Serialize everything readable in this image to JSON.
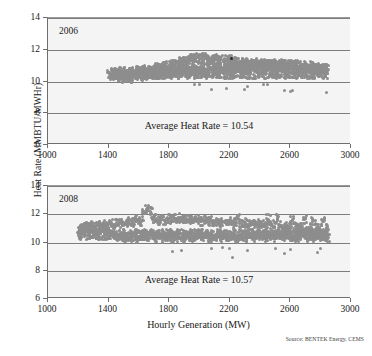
{
  "figure": {
    "xlabel": "Hourly Generation (MW)",
    "ylabel": "Heat Rate (MMBTU/MWHr)",
    "source_note": "Source: BENTEK Energy, CEMS"
  },
  "chart_data": [
    {
      "type": "scatter",
      "panel_label": "2006",
      "title": "",
      "xlabel": "Hourly Generation (MW)",
      "ylabel": "Heat Rate (MMBTU/MWHr)",
      "xlim": [
        1000,
        3000
      ],
      "ylim": [
        6,
        14
      ],
      "xticks": [
        1000,
        1400,
        1800,
        2200,
        2600,
        3000
      ],
      "yticks": [
        6,
        8,
        10,
        12,
        14
      ],
      "grid": "horizontal",
      "legend": "none",
      "annotation": "Average Heat Rate = 10.54",
      "average_heat_rate": 10.54,
      "marker_color": "#8d8d8d",
      "x": [
        1405,
        1418,
        1430,
        1442,
        1455,
        1462,
        1470,
        1478,
        1488,
        1495,
        1505,
        1512,
        1520,
        1528,
        1536,
        1544,
        1552,
        1560,
        1568,
        1576,
        1584,
        1592,
        1600,
        1608,
        1616,
        1624,
        1632,
        1640,
        1648,
        1656,
        1664,
        1672,
        1680,
        1688,
        1696,
        1704,
        1712,
        1720,
        1728,
        1736,
        1744,
        1752,
        1760,
        1768,
        1776,
        1784,
        1792,
        1800,
        1808,
        1816,
        1824,
        1832,
        1840,
        1848,
        1856,
        1864,
        1872,
        1880,
        1888,
        1896,
        1904,
        1912,
        1920,
        1928,
        1936,
        1944,
        1952,
        1960,
        1968,
        1976,
        1984,
        1992,
        2000,
        2008,
        2016,
        2024,
        2032,
        2040,
        2048,
        2056,
        2064,
        2072,
        2080,
        2088,
        2096,
        2104,
        2112,
        2120,
        2128,
        2136,
        2144,
        2152,
        2160,
        2168,
        2176,
        2184,
        2192,
        2200,
        2208,
        2216,
        2224,
        2232,
        2240,
        2248,
        2256,
        2264,
        2272,
        2280,
        2288,
        2296,
        2304,
        2312,
        2320,
        2328,
        2336,
        2344,
        2352,
        2360,
        2368,
        2376,
        2384,
        2392,
        2400,
        2408,
        2416,
        2424,
        2432,
        2440,
        2448,
        2456,
        2464,
        2472,
        2480,
        2488,
        2496,
        2504,
        2512,
        2520,
        2528,
        2536,
        2544,
        2552,
        2560,
        2568,
        2576,
        2584,
        2592,
        2600,
        2608,
        2616,
        2624,
        2632,
        2640,
        2648,
        2656,
        2664,
        2672,
        2680,
        2688,
        2696,
        2704,
        2712,
        2720,
        2728,
        2736,
        2744,
        2752,
        2760,
        2768,
        2776,
        2784,
        2792,
        2800,
        2808,
        2816,
        2824,
        2832,
        2840
      ],
      "y": [
        10.42,
        10.4,
        10.45,
        10.38,
        10.48,
        10.35,
        10.52,
        10.3,
        10.44,
        10.2,
        10.5,
        10.28,
        10.46,
        10.33,
        10.55,
        10.25,
        10.6,
        10.36,
        10.58,
        10.42,
        10.65,
        10.38,
        10.62,
        10.45,
        10.7,
        10.4,
        10.68,
        10.5,
        10.72,
        10.44,
        10.75,
        10.52,
        10.78,
        10.48,
        10.8,
        10.55,
        10.82,
        10.5,
        10.85,
        10.58,
        10.88,
        10.52,
        10.9,
        10.6,
        10.92,
        10.55,
        10.95,
        10.62,
        11.0,
        10.58,
        11.05,
        10.65,
        11.1,
        10.6,
        11.15,
        10.68,
        11.2,
        10.62,
        11.25,
        10.7,
        11.3,
        10.64,
        11.35,
        10.72,
        11.4,
        10.66,
        11.45,
        10.75,
        11.5,
        10.68,
        11.55,
        10.78,
        11.4,
        10.7,
        11.48,
        10.8,
        11.52,
        10.72,
        11.45,
        10.82,
        11.38,
        10.74,
        11.42,
        10.84,
        11.35,
        10.76,
        11.4,
        10.86,
        11.3,
        10.78,
        11.36,
        10.88,
        11.28,
        10.8,
        11.34,
        10.9,
        11.25,
        11.4,
        10.82,
        11.3,
        10.92,
        11.22,
        10.84,
        11.26,
        10.94,
        11.2,
        10.86,
        11.24,
        10.96,
        11.18,
        10.88,
        11.22,
        10.98,
        11.15,
        10.9,
        11.2,
        11.0,
        11.12,
        10.92,
        11.18,
        11.02,
        11.1,
        10.94,
        11.16,
        11.04,
        11.08,
        10.96,
        11.14,
        11.05,
        11.06,
        10.98,
        11.12,
        11.0,
        11.04,
        10.9,
        11.1,
        10.95,
        11.02,
        10.88,
        11.08,
        10.93,
        11.0,
        10.86,
        11.06,
        10.91,
        10.98,
        10.84,
        11.04,
        10.89,
        10.96,
        10.82,
        11.02,
        10.87,
        10.94,
        10.8,
        11.0,
        10.85,
        10.92,
        10.78,
        10.98,
        10.83,
        10.9,
        10.76,
        10.96,
        10.81,
        10.88,
        10.74,
        10.94,
        10.79,
        10.86,
        10.72,
        10.92,
        10.77,
        10.84,
        10.7,
        10.9,
        10.75,
        10.82,
        10.68,
        10.88,
        10.73,
        10.8,
        10.66,
        10.86,
        10.71
      ],
      "outliers_low": {
        "x": [
          1965,
          2000,
          2080,
          2180,
          2300,
          2320,
          2420,
          2450,
          2560,
          2600,
          2615,
          2840
        ],
        "y": [
          9.78,
          9.82,
          9.52,
          9.55,
          9.52,
          9.7,
          9.8,
          9.78,
          9.42,
          9.4,
          9.45,
          9.3
        ]
      },
      "highlighted_point": {
        "x": 2210,
        "y": 11.42,
        "color": "#2b2b2b"
      }
    },
    {
      "type": "scatter",
      "panel_label": "2008",
      "title": "",
      "xlabel": "Hourly Generation (MW)",
      "ylabel": "Heat Rate (MMBTU/MWHr)",
      "xlim": [
        1000,
        3000
      ],
      "ylim": [
        6,
        14
      ],
      "xticks": [
        1000,
        1400,
        1800,
        2200,
        2600,
        3000
      ],
      "yticks": [
        6,
        8,
        10,
        12,
        14
      ],
      "grid": "horizontal",
      "legend": "none",
      "annotation": "Average Heat Rate = 10.57",
      "average_heat_rate": 10.57,
      "marker_color": "#8d8d8d",
      "x": [
        1205,
        1215,
        1225,
        1235,
        1245,
        1255,
        1265,
        1275,
        1285,
        1295,
        1305,
        1315,
        1325,
        1335,
        1345,
        1355,
        1365,
        1375,
        1385,
        1395,
        1405,
        1415,
        1425,
        1435,
        1445,
        1455,
        1465,
        1475,
        1485,
        1495,
        1505,
        1515,
        1525,
        1535,
        1545,
        1555,
        1565,
        1575,
        1585,
        1595,
        1605,
        1615,
        1625,
        1635,
        1645,
        1655,
        1665,
        1675,
        1685,
        1695,
        1705,
        1715,
        1725,
        1735,
        1745,
        1755,
        1765,
        1775,
        1785,
        1795,
        1805,
        1815,
        1825,
        1835,
        1845,
        1855,
        1865,
        1875,
        1885,
        1895,
        1905,
        1915,
        1925,
        1935,
        1945,
        1955,
        1965,
        1975,
        1985,
        1995,
        2005,
        2015,
        2025,
        2035,
        2045,
        2055,
        2065,
        2075,
        2085,
        2095,
        2105,
        2115,
        2125,
        2135,
        2145,
        2155,
        2165,
        2175,
        2185,
        2195,
        2205,
        2215,
        2225,
        2235,
        2245,
        2255,
        2265,
        2275,
        2285,
        2295,
        2305,
        2315,
        2325,
        2335,
        2345,
        2355,
        2365,
        2375,
        2385,
        2395,
        2405,
        2415,
        2425,
        2435,
        2445,
        2455,
        2465,
        2475,
        2485,
        2495,
        2505,
        2515,
        2525,
        2535,
        2545,
        2555,
        2565,
        2575,
        2585,
        2595,
        2605,
        2615,
        2625,
        2635,
        2645,
        2655,
        2665,
        2675,
        2685,
        2695,
        2705,
        2715,
        2725,
        2735,
        2745,
        2755,
        2765,
        2775,
        2785,
        2795,
        2805,
        2815,
        2825,
        2835,
        2845
      ],
      "y": [
        10.9,
        11.02,
        10.85,
        11.1,
        10.8,
        11.15,
        10.95,
        11.05,
        10.75,
        11.2,
        10.88,
        11.12,
        10.7,
        11.25,
        10.92,
        11.18,
        10.78,
        11.3,
        10.96,
        11.22,
        10.65,
        11.35,
        10.6,
        11.28,
        10.5,
        11.4,
        10.45,
        11.32,
        10.4,
        11.45,
        10.35,
        11.38,
        10.42,
        11.5,
        10.38,
        11.42,
        10.48,
        11.55,
        10.32,
        11.6,
        10.44,
        11.48,
        10.3,
        12.1,
        10.5,
        12.35,
        10.4,
        12.2,
        10.55,
        11.62,
        10.36,
        11.7,
        10.46,
        11.58,
        10.28,
        11.66,
        10.52,
        11.54,
        10.34,
        11.72,
        10.42,
        11.6,
        10.26,
        11.68,
        10.58,
        11.56,
        10.38,
        11.74,
        10.48,
        11.62,
        10.3,
        11.7,
        10.54,
        11.58,
        10.4,
        11.66,
        10.32,
        11.54,
        10.5,
        11.62,
        10.44,
        11.5,
        10.36,
        11.58,
        10.56,
        11.46,
        10.28,
        11.54,
        10.48,
        11.42,
        10.38,
        11.5,
        10.6,
        11.38,
        10.3,
        11.46,
        10.52,
        11.34,
        10.42,
        11.42,
        10.34,
        11.5,
        10.62,
        11.38,
        10.26,
        11.7,
        10.46,
        11.34,
        10.56,
        11.42,
        10.36,
        11.3,
        10.5,
        11.38,
        10.64,
        11.26,
        10.4,
        11.34,
        10.54,
        11.22,
        10.44,
        11.3,
        10.58,
        11.18,
        10.34,
        11.66,
        10.48,
        11.26,
        10.6,
        11.14,
        10.38,
        11.7,
        10.52,
        11.22,
        10.42,
        11.1,
        10.56,
        11.18,
        10.62,
        11.06,
        10.36,
        11.58,
        10.46,
        11.14,
        10.3,
        11.02,
        10.5,
        11.1,
        10.64,
        11.62,
        10.4,
        10.98,
        10.54,
        11.06,
        10.34,
        11.54,
        10.44,
        11.02,
        10.58,
        10.94,
        10.38,
        11.5,
        10.48,
        10.98,
        10.32,
        10.9,
        10.52,
        10.42,
        10.36,
        10.46,
        10.3
      ],
      "outliers_low": {
        "x": [
          1825,
          1880,
          2080,
          2150,
          2200,
          2215,
          2320,
          2500,
          2560,
          2600,
          2780,
          2800
        ],
        "y": [
          9.35,
          9.42,
          9.55,
          9.62,
          9.58,
          8.92,
          9.45,
          9.6,
          9.22,
          9.5,
          9.32,
          9.58
        ]
      }
    }
  ]
}
